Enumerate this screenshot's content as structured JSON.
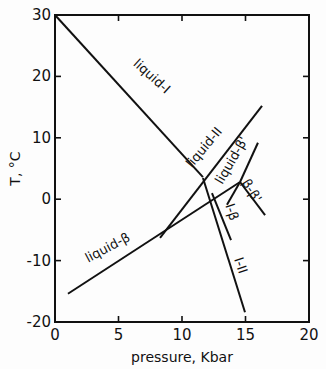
{
  "chart_data": {
    "type": "line",
    "title": "",
    "xlabel": "pressure, Kbar",
    "ylabel": "T, °C",
    "xlim": [
      0,
      20
    ],
    "ylim": [
      -20,
      30
    ],
    "xticks": [
      0,
      5,
      10,
      15,
      20
    ],
    "yticks": [
      30,
      20,
      10,
      0,
      -10,
      -20
    ],
    "xtick_labels": [
      "0",
      "5",
      "10",
      "15",
      "20"
    ],
    "ytick_labels": [
      "30",
      "20",
      "10",
      "0",
      "-10",
      "-20"
    ],
    "grid": false,
    "legend": null,
    "series": [
      {
        "name": "liquid-I",
        "x": [
          0.0,
          11.65
        ],
        "y": [
          30.0,
          3.6
        ]
      },
      {
        "name": "liquid-II",
        "x": [
          8.27,
          16.3
        ],
        "y": [
          -6.3,
          15.2
        ]
      },
      {
        "name": "liquid-β",
        "x": [
          1.02,
          14.57
        ],
        "y": [
          -15.4,
          2.8
        ]
      },
      {
        "name": "liquid-β'",
        "x": [
          14.57,
          15.98
        ],
        "y": [
          2.8,
          9.2
        ]
      },
      {
        "name": "β-β'",
        "x": [
          14.57,
          16.54
        ],
        "y": [
          2.8,
          -2.6
        ]
      },
      {
        "name": "I-β",
        "x": [
          12.36,
          13.86
        ],
        "y": [
          1.0,
          -6.65
        ]
      },
      {
        "name": "I-β (short)",
        "x": [
          14.57,
          13.54
        ],
        "y": [
          2.8,
          -0.9
        ]
      },
      {
        "name": "I-II",
        "x": [
          11.65,
          14.96
        ],
        "y": [
          3.45,
          -18.4
        ]
      }
    ],
    "annotations": [
      {
        "text": "liquid-I",
        "x": 7.4,
        "y": 19.5,
        "angle": 42
      },
      {
        "text": "liquid-II",
        "x": 12.0,
        "y": 8.0,
        "angle": -50
      },
      {
        "text": "liquid-β'",
        "x": 14.2,
        "y": 6.0,
        "angle": -60
      },
      {
        "text": "liquid-β",
        "x": 4.3,
        "y": -8.5,
        "angle": -28
      },
      {
        "text": "β-β'",
        "x": 15.2,
        "y": 1.0,
        "angle": 58
      },
      {
        "text": "I-β",
        "x": 13.6,
        "y": -2.3,
        "angle": 72
      },
      {
        "text": "I-II",
        "x": 14.3,
        "y": -11.0,
        "angle": 72
      }
    ]
  }
}
